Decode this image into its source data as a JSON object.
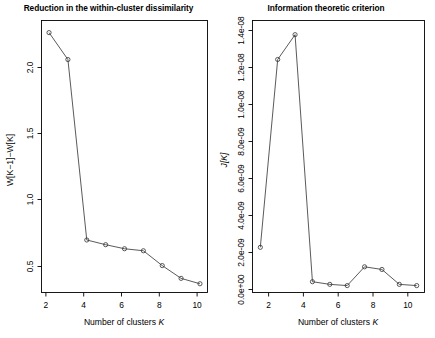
{
  "figure": {
    "width": 435,
    "height": 338,
    "background": "#ffffff",
    "line_color": "#3c3c3c",
    "axis_color": "#000000"
  },
  "panels": [
    {
      "id": "left",
      "title": "Reduction in the within-cluster dissimilarity",
      "xlabel_prefix": "Number of clusters ",
      "xlabel_symbol": "K",
      "ylabel": "W[K−1]−W[K]",
      "xticks": [
        "2",
        "4",
        "6",
        "8",
        "10"
      ],
      "yticks": [
        "0.5",
        "1.0",
        "1.5",
        "2.0"
      ]
    },
    {
      "id": "right",
      "title": "Information theoretic criterion",
      "xlabel_prefix": "Number of clusters ",
      "xlabel_symbol": "K",
      "ylabel": "J[K]",
      "xticks": [
        "2",
        "4",
        "6",
        "8",
        "10"
      ],
      "yticks": [
        "0.0e+00",
        "2.0e-09",
        "4.0e-09",
        "6.0e-09",
        "8.0e-09",
        "1.0e-08",
        "1.2e-08",
        "1.4e-08"
      ]
    }
  ],
  "chart_data": [
    {
      "type": "line",
      "panel": "left",
      "title": "Reduction in the within-cluster dissimilarity",
      "xlabel": "Number of clusters K",
      "ylabel": "W[K-1]-W[K]",
      "x": [
        2,
        3,
        4,
        5,
        6,
        7,
        8,
        9,
        10
      ],
      "values": [
        2.15,
        1.95,
        0.61,
        0.575,
        0.545,
        0.53,
        0.42,
        0.325,
        0.285
      ],
      "xlim": [
        1.6,
        10.4
      ],
      "ylim": [
        0.22,
        2.24
      ],
      "grid": false,
      "legend": null,
      "marker": "open-circle"
    },
    {
      "type": "line",
      "panel": "right",
      "title": "Information theoretic criterion",
      "xlabel": "Number of clusters K",
      "ylabel": "J[K]",
      "x": [
        1,
        2,
        3,
        4,
        5,
        6,
        7,
        8,
        9,
        10
      ],
      "values": [
        2.2e-09,
        1.28e-08,
        1.42e-08,
        2.6e-10,
        1.1e-10,
        4e-11,
        1.1e-09,
        9.5e-10,
        1.1e-10,
        4e-11
      ],
      "xlim": [
        0.55,
        10.45
      ],
      "ylim": [
        -3.5e-10,
        1.5e-08
      ],
      "grid": false,
      "legend": null,
      "marker": "open-circle"
    }
  ]
}
